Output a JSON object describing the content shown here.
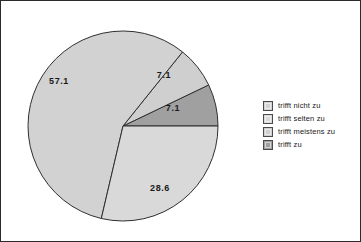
{
  "chart_data": {
    "type": "pie",
    "title": "",
    "labels": [
      "trifft nicht zu",
      "trifft selten zu",
      "trifft meistens zu",
      "trifft zu"
    ],
    "values": [
      57.1,
      28.6,
      7.1,
      7.1
    ],
    "value_labels": [
      "57.1",
      "28.6",
      "7.1",
      "7.1"
    ],
    "unit": "percent",
    "legend_position": "right",
    "grid": false,
    "colors": [
      "#d2d2d2",
      "#d9d9d9",
      "#cfcfcf",
      "#a0a0a0"
    ],
    "slice_outline_color": "#2f2f2f",
    "background": "#ffffff",
    "border_color": "#2b2b2b",
    "slices": [
      {
        "label": "trifft zu",
        "value": 7.1,
        "value_label": "7.1",
        "color": "#a0a0a0",
        "start_angle": 0,
        "end_angle": 25.6,
        "label_x": 172,
        "label_y": 108
      },
      {
        "label": "trifft meistens zu",
        "value": 7.1,
        "value_label": "7.1",
        "color": "#cfcfcf",
        "start_angle": 25.6,
        "end_angle": 51.2,
        "label_x": 163,
        "label_y": 75
      },
      {
        "label": "trifft nicht zu",
        "value": 57.1,
        "value_label": "57.1",
        "color": "#d2d2d2",
        "start_angle": 51.2,
        "end_angle": 256.8,
        "label_x": 58,
        "label_y": 81
      },
      {
        "label": "trifft selten zu",
        "value": 28.6,
        "value_label": "28.6",
        "color": "#d9d9d9",
        "start_angle": 256.8,
        "end_angle": 360,
        "label_x": 159,
        "label_y": 188
      }
    ]
  },
  "legend": {
    "items": [
      {
        "label": "trifft nicht zu",
        "color": "#d2d2d2"
      },
      {
        "label": "trifft selten zu",
        "color": "#d9d9d9"
      },
      {
        "label": "trifft meistens zu",
        "color": "#cfcfcf"
      },
      {
        "label": "trifft zu",
        "color": "#a0a0a0"
      }
    ]
  }
}
